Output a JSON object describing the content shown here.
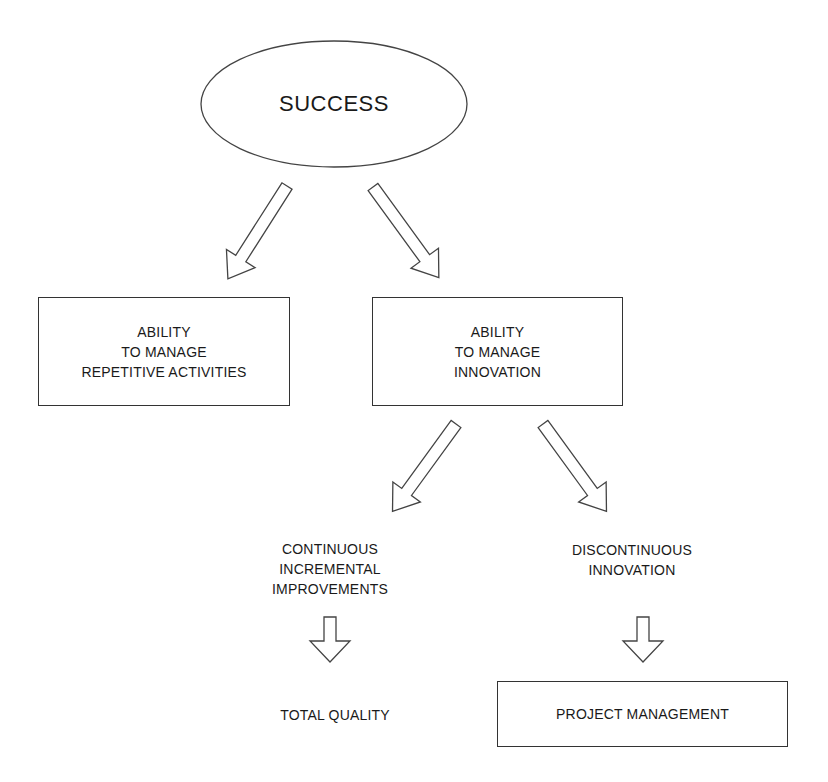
{
  "diagram": {
    "root": {
      "label": "SUCCESS",
      "shape": "ellipse"
    },
    "level1": [
      {
        "id": "repetitive",
        "label": "ABILITY\nTO MANAGE\nREPETITIVE ACTIVITIES",
        "shape": "box"
      },
      {
        "id": "innovation",
        "label": "ABILITY\nTO MANAGE\nINNOVATION",
        "shape": "box"
      }
    ],
    "level2": [
      {
        "id": "continuous",
        "label": "CONTINUOUS\nINCREMENTAL\nIMPROVEMENTS",
        "shape": "text"
      },
      {
        "id": "discontinuous",
        "label": "DISCONTINUOUS\nINNOVATION",
        "shape": "text"
      }
    ],
    "level3": [
      {
        "id": "total-quality",
        "label": "TOTAL QUALITY",
        "shape": "text"
      },
      {
        "id": "project-management",
        "label": "PROJECT MANAGEMENT",
        "shape": "box"
      }
    ],
    "edges": [
      {
        "from": "SUCCESS",
        "to": "repetitive",
        "style": "hollow-arrow"
      },
      {
        "from": "SUCCESS",
        "to": "innovation",
        "style": "hollow-arrow"
      },
      {
        "from": "innovation",
        "to": "continuous",
        "style": "hollow-arrow"
      },
      {
        "from": "innovation",
        "to": "discontinuous",
        "style": "hollow-arrow"
      },
      {
        "from": "continuous",
        "to": "total-quality",
        "style": "hollow-arrow"
      },
      {
        "from": "discontinuous",
        "to": "project-management",
        "style": "hollow-arrow"
      }
    ],
    "colors": {
      "stroke": "#333333",
      "text": "#1a1a1a",
      "background": "#ffffff"
    }
  }
}
